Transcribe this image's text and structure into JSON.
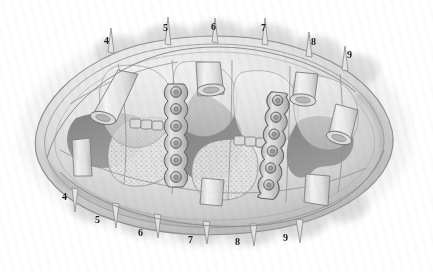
{
  "figure": {
    "width": 433,
    "height": 272,
    "background_color": "#ffffff",
    "style": "grayscale pencil/airbrush medical illustration",
    "vignette_color": "#b9b9b9"
  },
  "palette": {
    "paper": "#ffffff",
    "halo_light": "#e7e7e7",
    "halo_mid": "#c9c9c9",
    "halo_dark": "#ababab",
    "tissue_light": "#efefef",
    "tissue_mid": "#d6d6d6",
    "tissue_shadow": "#b0b0b0",
    "cavity_dark": "#8b8b8b",
    "cavity_darker": "#7a7a7a",
    "outline": "#6e6e6e",
    "plate_fill": "#d2d2d2",
    "plate_outline": "#5f5f5f",
    "screw_fill": "#bdbdbd",
    "label_color": "#1c1c1c"
  },
  "labels": {
    "top": [
      {
        "id": "label-top-4",
        "text": "4",
        "x": 104,
        "y": 36
      },
      {
        "id": "label-top-5",
        "text": "5",
        "x": 163,
        "y": 23
      },
      {
        "id": "label-top-6",
        "text": "6",
        "x": 211,
        "y": 22
      },
      {
        "id": "label-top-7",
        "text": "7",
        "x": 261,
        "y": 23
      },
      {
        "id": "label-top-8",
        "text": "8",
        "x": 311,
        "y": 37
      },
      {
        "id": "label-top-9",
        "text": "9",
        "x": 347,
        "y": 50
      }
    ],
    "bottom": [
      {
        "id": "label-bottom-4",
        "text": "4",
        "x": 62,
        "y": 192
      },
      {
        "id": "label-bottom-5",
        "text": "5",
        "x": 95,
        "y": 215
      },
      {
        "id": "label-bottom-6",
        "text": "6",
        "x": 138,
        "y": 228
      },
      {
        "id": "label-bottom-7",
        "text": "7",
        "x": 188,
        "y": 235
      },
      {
        "id": "label-bottom-8",
        "text": "8",
        "x": 235,
        "y": 237
      },
      {
        "id": "label-bottom-9",
        "text": "9",
        "x": 283,
        "y": 233
      }
    ]
  },
  "structures": {
    "outer_rim": "oval soft-tissue mass with feathered airbrush halo",
    "spikes_top_count": 6,
    "spikes_bottom_count": 6,
    "fixation_plates": [
      {
        "id": "plate-left",
        "orientation": "vertical",
        "screw_count": 6,
        "x": 174,
        "y_top": 84,
        "y_bottom": 186
      },
      {
        "id": "plate-right",
        "orientation": "vertical-tilted",
        "screw_count": 7,
        "x": 272,
        "y_top": 92,
        "y_bottom": 198
      }
    ],
    "cut_tubes": [
      {
        "id": "cut-tube-upper-left",
        "x": 100,
        "y": 108
      },
      {
        "id": "cut-tube-upper-mid",
        "x": 210,
        "y": 88
      },
      {
        "id": "cut-tube-upper-right",
        "x": 305,
        "y": 98
      },
      {
        "id": "cut-tube-right",
        "x": 343,
        "y": 135
      }
    ],
    "cavities": [
      {
        "id": "cavity-left",
        "tone": "#8b8b8b"
      },
      {
        "id": "cavity-center",
        "tone": "#858585"
      },
      {
        "id": "cavity-right",
        "tone": "#8b8b8b"
      }
    ]
  }
}
